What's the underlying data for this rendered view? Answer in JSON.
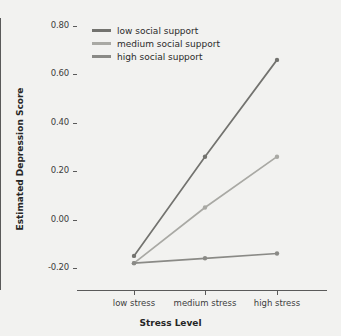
{
  "chart_data": {
    "type": "line",
    "title": "",
    "xlabel": "Stress Level",
    "ylabel": "Estimated Depression Score",
    "categories": [
      "low stress",
      "medium stress",
      "high stress"
    ],
    "ylim": [
      -0.2,
      0.8
    ],
    "yticks": [
      "0.80",
      "0.60",
      "0.40",
      "0.20",
      "0.00",
      "-0.20"
    ],
    "ytick_values": [
      0.8,
      0.6,
      0.4,
      0.2,
      0.0,
      -0.2
    ],
    "grid": false,
    "legend_position": "top-left",
    "series": [
      {
        "name": "low social support",
        "values": [
          -0.15,
          0.26,
          0.66
        ],
        "color": "#73736f"
      },
      {
        "name": "medium social support",
        "values": [
          -0.18,
          0.05,
          0.26
        ],
        "color": "#a9a9a4"
      },
      {
        "name": "high social support",
        "values": [
          -0.18,
          -0.16,
          -0.14
        ],
        "color": "#8a8a86"
      }
    ]
  },
  "axis": {
    "x_title": "Stress Level",
    "y_title": "Estimated Depression Score"
  },
  "legend": {
    "items": [
      {
        "label": "low social support"
      },
      {
        "label": "medium social support"
      },
      {
        "label": "high social support"
      }
    ]
  },
  "style": {
    "background": "#f2f2f0",
    "axis_color": "#5a5a5a",
    "tick_text_color": "#3d3d3d",
    "title_color": "#262626"
  }
}
